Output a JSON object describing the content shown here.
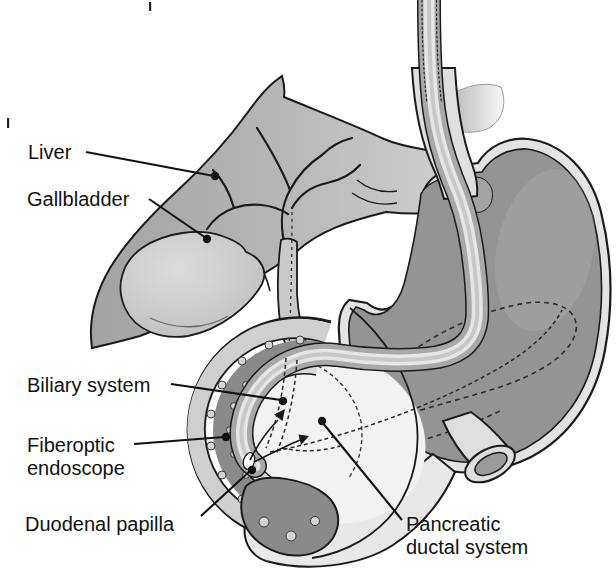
{
  "figure": {
    "labels": {
      "liver": "Liver",
      "gallbladder": "Gallbladder",
      "biliary_system": "Biliary system",
      "fiberoptic_endoscope_line1": "Fiberoptic",
      "fiberoptic_endoscope_line2": "endoscope",
      "duodenal_papilla": "Duodenal papilla",
      "pancreatic_ductal_line1": "Pancreatic",
      "pancreatic_ductal_line2": "ductal system"
    },
    "colors": {
      "background": "#ffffff",
      "outline": "#1a1a1a",
      "liver": "#b2b2b2",
      "gallbladder": "#c9c9c9",
      "stomach_wall": "#e3e3e3",
      "stomach_interior": "#949494",
      "duodenum_outer_wall": "#cfcfcf",
      "duodenum_mucosa": "#8a8a8a",
      "endoscope_sheath": "#a8a8a8",
      "endoscope_core": "#e6e6e6",
      "pancreas_head": "#f2f2f2",
      "label_text": "#111111"
    }
  }
}
